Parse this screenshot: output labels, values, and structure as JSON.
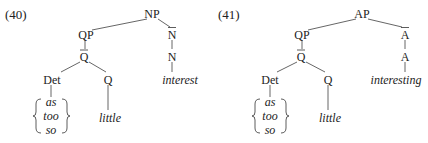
{
  "diagrams": [
    {
      "label": "(40)",
      "root": "NP",
      "nodes": {
        "root": {
          "text": "NP",
          "bar": false
        },
        "qp": {
          "text": "QP",
          "bar": false
        },
        "nbar": {
          "text": "N",
          "bar": true
        },
        "qbar": {
          "text": "Q",
          "bar": true
        },
        "n": {
          "text": "N",
          "bar": false
        },
        "det": {
          "text": "Det",
          "bar": false
        },
        "q": {
          "text": "Q",
          "bar": false
        },
        "head_word": {
          "text": "interest",
          "italic": true
        },
        "det_options": [
          "as",
          "too",
          "so"
        ],
        "q_word": {
          "text": "little",
          "italic": true
        }
      }
    },
    {
      "label": "(41)",
      "root": "AP",
      "nodes": {
        "root": {
          "text": "AP",
          "bar": false
        },
        "qp": {
          "text": "QP",
          "bar": false
        },
        "nbar": {
          "text": "A",
          "bar": true
        },
        "qbar": {
          "text": "Q",
          "bar": true
        },
        "n": {
          "text": "A",
          "bar": false
        },
        "det": {
          "text": "Det",
          "bar": false
        },
        "q": {
          "text": "Q",
          "bar": false
        },
        "head_word": {
          "text": "interesting",
          "italic": true
        },
        "det_options": [
          "as",
          "too",
          "so"
        ],
        "q_word": {
          "text": "little",
          "italic": true
        }
      }
    }
  ]
}
